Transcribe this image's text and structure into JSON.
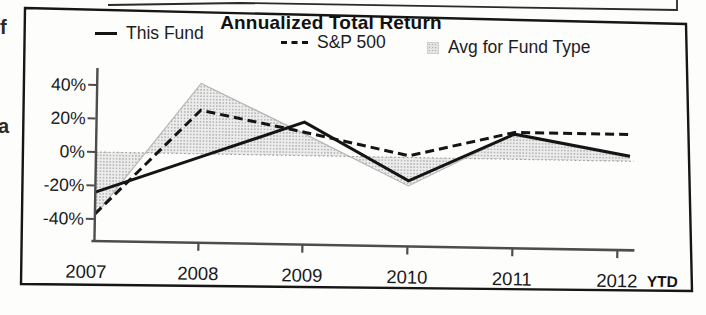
{
  "page": {
    "marginalia": {
      "glyph_top": "f",
      "glyph_middle": "a"
    }
  },
  "card": {
    "title": "Annualized Total Return",
    "legend": [
      {
        "label": "This Fund",
        "marker": "solid-line"
      },
      {
        "label": "S&P 500",
        "marker": "dashed-line"
      },
      {
        "label": "Avg for Fund Type",
        "marker": "shaded-square"
      }
    ]
  },
  "chart_data": {
    "type": "line",
    "title": "Annualized Total Return",
    "categories": [
      "2007",
      "2008",
      "2009",
      "2010",
      "2011",
      "2012"
    ],
    "x_suffix_label": "YTD",
    "series": [
      {
        "name": "This Fund",
        "style": "solid-line",
        "values": [
          -24,
          -2,
          20,
          -14,
          15,
          3
        ]
      },
      {
        "name": "S&P 500",
        "style": "dashed-line",
        "values": [
          -37,
          26,
          14,
          1,
          16,
          16
        ]
      },
      {
        "name": "Avg for Fund Type",
        "style": "shaded-area-vs-zero",
        "values": [
          -38,
          42,
          13,
          -17,
          15,
          2
        ]
      }
    ],
    "ylabel": "",
    "xlabel": "",
    "y_ticks": [
      {
        "label": "40%",
        "value": 40
      },
      {
        "label": "20%",
        "value": 20
      },
      {
        "label": "0%",
        "value": 0
      },
      {
        "label": "-20%",
        "value": -20
      },
      {
        "label": "-40%",
        "value": -40
      }
    ],
    "ylim": [
      -50,
      52
    ],
    "gridlines": "dotted line at 0% only",
    "legend_position": "top"
  },
  "colors": {
    "line": "#141414",
    "area_fill_dot": "#a8a8a8",
    "area_fill_bg": "#e9e9e9",
    "area_edge": "#b5b5b5",
    "axis": "#4d4d4d",
    "grid_zero": "#9a9a9a",
    "text": "#1a1a1a",
    "border": "#161616"
  }
}
